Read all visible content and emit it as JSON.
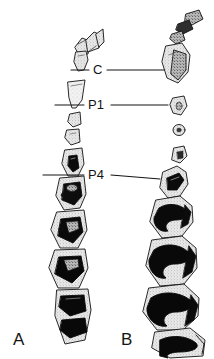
{
  "figure": {
    "kind": "scientific-line-illustration",
    "background_color": "#ffffff",
    "ink_color": "#111111",
    "enamel_fill_color": "#0a0a0a",
    "dentine_fill_color": "#cfcfcf",
    "stipple_color": "#8c8c8c",
    "width": 214,
    "height": 359
  },
  "panels": [
    {
      "id": "A",
      "label": "A",
      "side": "left",
      "description": "narrow, nearly straight tooth row; small incisor arcade at top, tall conical canine, three reduced premolars, then four molars with triangular black enamel fossettes"
    },
    {
      "id": "B",
      "label": "B",
      "side": "right",
      "description": "broader tooth row; incisors angled up to the right, large dark canine, three isolated peg-like premolars, then molars with broad sinuous S-shaped enamel lophs"
    }
  ],
  "callouts": [
    {
      "id": "C",
      "label": "C",
      "meaning": "canine",
      "leader_left": true,
      "leader_right": true,
      "y": 70
    },
    {
      "id": "P1",
      "label": "P1",
      "meaning": "first premolar",
      "leader_left": true,
      "leader_right": true,
      "y": 105
    },
    {
      "id": "P4",
      "label": "P4",
      "meaning": "fourth premolar",
      "leader_left": true,
      "leader_right": true,
      "y": 175
    }
  ]
}
